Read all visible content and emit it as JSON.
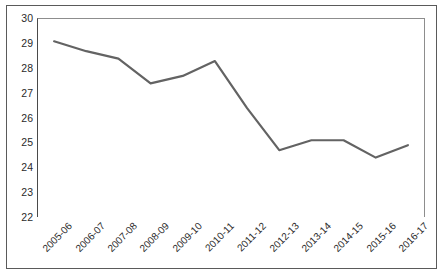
{
  "chart_data": {
    "type": "line",
    "title": "",
    "subtitle": "",
    "xlabel": "",
    "ylabel": "",
    "categories": [
      "2005-06",
      "2006-07",
      "2007-08",
      "2008-09",
      "2009-10",
      "2010-11",
      "2011-12",
      "2012-13",
      "2013-14",
      "2014-15",
      "2015-16",
      "2016-17"
    ],
    "values": [
      29.1,
      28.7,
      28.4,
      27.4,
      27.7,
      28.3,
      26.4,
      24.7,
      25.1,
      25.1,
      24.4,
      24.9
    ],
    "series": [
      {
        "name": "",
        "values": [
          29.1,
          28.7,
          28.4,
          27.4,
          27.7,
          28.3,
          26.4,
          24.7,
          25.1,
          25.1,
          24.4,
          24.9
        ],
        "color": "#636363"
      }
    ],
    "ylim": [
      22,
      30
    ],
    "yticks": [
      22,
      23,
      24,
      25,
      26,
      27,
      28,
      29,
      30
    ],
    "ytick_labels": [
      "22",
      "23",
      "24",
      "25",
      "26",
      "27",
      "28",
      "29",
      "30"
    ],
    "grid": false,
    "legend": false,
    "legend_position": "none",
    "markers": false,
    "line_width": 2.2,
    "annotations": []
  },
  "colors": {
    "line": "#636363",
    "axis": "#4a4a4a",
    "frame": "#5a5a5a",
    "text": "#2b2b2b",
    "background": "#ffffff"
  }
}
